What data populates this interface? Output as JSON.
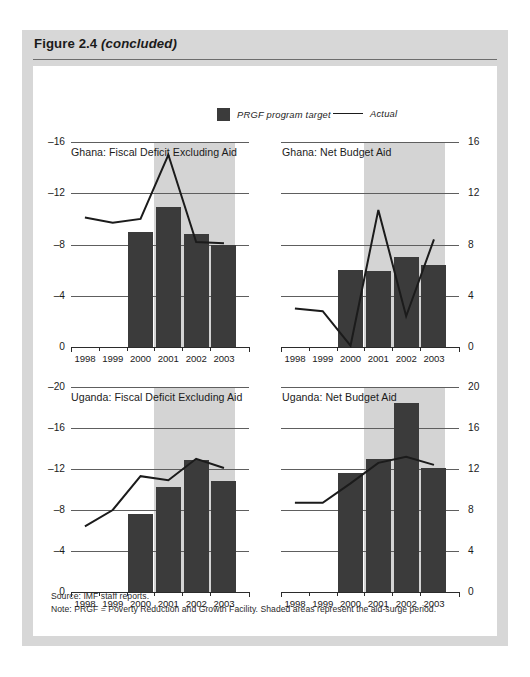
{
  "figure": {
    "title_main": "Figure 2.4",
    "title_suffix": "(concluded)"
  },
  "legend": {
    "target_label": "PRGF program target",
    "actual_label": "Actual",
    "bar_color": "#3b3b3b",
    "line_color": "#1b1b1b"
  },
  "footnotes": {
    "source": "Source: IMF staff reports.",
    "note": "Note: PRGF = Poverty Reduction and Growth Facility. Shaded areas represent the aid-surge period."
  },
  "chart_data": [
    {
      "id": "ghana-fiscal-deficit",
      "type": "bar",
      "title": "Ghana: Fiscal Deficit Excluding Aid",
      "axis_side": "left",
      "categories": [
        "1998",
        "1999",
        "2000",
        "2001",
        "2002",
        "2003"
      ],
      "x": [
        1998,
        1999,
        2000,
        2001,
        2002,
        2003
      ],
      "ylim": [
        0,
        16
      ],
      "yticks": [
        0,
        4,
        8,
        12,
        16
      ],
      "ytick_labels": [
        "0",
        "–4",
        "–8",
        "–12",
        "–16"
      ],
      "grid": true,
      "shaded_start": 2000.5,
      "shaded_end": 2003.4,
      "series": [
        {
          "name": "PRGF program target",
          "kind": "bar",
          "values": [
            null,
            null,
            9.0,
            10.9,
            8.8,
            8.0
          ]
        },
        {
          "name": "Actual",
          "kind": "line",
          "values": [
            10.1,
            9.7,
            10.0,
            15.0,
            8.2,
            8.1
          ]
        }
      ]
    },
    {
      "id": "ghana-net-budget-aid",
      "type": "bar",
      "title": "Ghana: Net Budget Aid",
      "axis_side": "right",
      "categories": [
        "1998",
        "1999",
        "2000",
        "2001",
        "2002",
        "2003"
      ],
      "x": [
        1998,
        1999,
        2000,
        2001,
        2002,
        2003
      ],
      "ylim": [
        0,
        16
      ],
      "yticks": [
        0,
        4,
        8,
        12,
        16
      ],
      "ytick_labels": [
        "0",
        "4",
        "8",
        "12",
        "16"
      ],
      "grid": true,
      "shaded_start": 2000.5,
      "shaded_end": 2003.4,
      "series": [
        {
          "name": "PRGF program target",
          "kind": "bar",
          "values": [
            null,
            null,
            6.0,
            5.9,
            7.0,
            6.4
          ]
        },
        {
          "name": "Actual",
          "kind": "line",
          "values": [
            3.0,
            2.8,
            0.1,
            10.7,
            2.4,
            8.4
          ]
        }
      ]
    },
    {
      "id": "uganda-fiscal-deficit",
      "type": "bar",
      "title": "Uganda: Fiscal Deficit Excluding Aid",
      "axis_side": "left",
      "categories": [
        "1998",
        "1999",
        "2000",
        "2001",
        "2002",
        "2003"
      ],
      "x": [
        1998,
        1999,
        2000,
        2001,
        2002,
        2003
      ],
      "ylim": [
        0,
        20
      ],
      "yticks": [
        0,
        4,
        8,
        12,
        16,
        20
      ],
      "ytick_labels": [
        "0",
        "–4",
        "–8",
        "–12",
        "–16",
        "–20"
      ],
      "grid": true,
      "shaded_start": 2000.5,
      "shaded_end": 2003.4,
      "series": [
        {
          "name": "PRGF program target",
          "kind": "bar",
          "values": [
            null,
            null,
            7.6,
            10.2,
            12.9,
            10.8
          ]
        },
        {
          "name": "Actual",
          "kind": "line",
          "values": [
            6.4,
            8.0,
            11.3,
            10.9,
            13.0,
            12.1
          ]
        }
      ]
    },
    {
      "id": "uganda-net-budget-aid",
      "type": "bar",
      "title": "Uganda: Net Budget Aid",
      "axis_side": "right",
      "categories": [
        "1998",
        "1999",
        "2000",
        "2001",
        "2002",
        "2003"
      ],
      "x": [
        1998,
        1999,
        2000,
        2001,
        2002,
        2003
      ],
      "ylim": [
        0,
        20
      ],
      "yticks": [
        0,
        4,
        8,
        12,
        16,
        20
      ],
      "ytick_labels": [
        "0",
        "4",
        "8",
        "12",
        "16",
        "20"
      ],
      "grid": true,
      "shaded_start": 2000.5,
      "shaded_end": 2003.4,
      "series": [
        {
          "name": "PRGF program target",
          "kind": "bar",
          "values": [
            null,
            null,
            11.6,
            13.0,
            18.4,
            12.1
          ]
        },
        {
          "name": "Actual",
          "kind": "line",
          "values": [
            8.7,
            8.7,
            10.6,
            12.6,
            13.2,
            12.4
          ]
        }
      ]
    }
  ]
}
